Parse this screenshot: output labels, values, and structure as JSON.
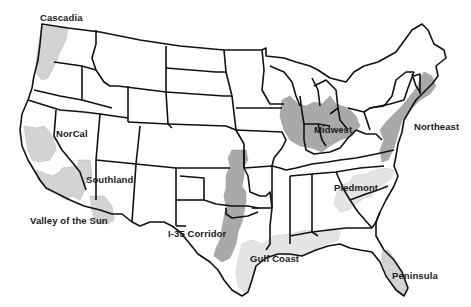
{
  "map": {
    "title": "U.S. Megaregions",
    "colors": {
      "background": "#ffffff",
      "state_border": "#111111",
      "region_dark": "#a9a9a9",
      "region_light": "#d3d3d3",
      "region_extra_light": "#e4e4e4"
    },
    "regions": [
      {
        "id": "cascadia",
        "label": "Cascadia"
      },
      {
        "id": "norcal",
        "label": "NorCal"
      },
      {
        "id": "southland",
        "label": "Southland"
      },
      {
        "id": "valley-of-the-sun",
        "label": "Valley of the Sun"
      },
      {
        "id": "i35-corridor",
        "label": "I-35 Corridor"
      },
      {
        "id": "gulf-coast",
        "label": "Gulf Coast"
      },
      {
        "id": "midwest",
        "label": "Midwest"
      },
      {
        "id": "northeast",
        "label": "Northeast"
      },
      {
        "id": "piedmont",
        "label": "Piedmont"
      },
      {
        "id": "peninsula",
        "label": "Peninsula"
      }
    ]
  }
}
